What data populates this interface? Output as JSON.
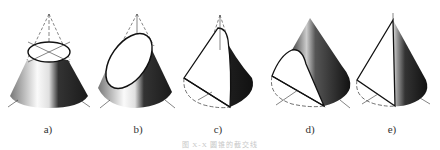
{
  "figure": {
    "caption": "图 X-X  圆锥的截交线",
    "panels": [
      {
        "id": "a",
        "label": "a)",
        "section": "circle (plane perpendicular to axis)"
      },
      {
        "id": "b",
        "label": "b)",
        "section": "ellipse (inclined plane)"
      },
      {
        "id": "c",
        "label": "c)",
        "section": "parabola (plane parallel to one generatrix)"
      },
      {
        "id": "d",
        "label": "d)",
        "section": "hyperbola (plane parallel to axis)"
      },
      {
        "id": "e",
        "label": "e)",
        "section": "triangle (plane through apex)"
      }
    ],
    "colors": {
      "outline": "#111111",
      "shade_dark": "#1a1a1a",
      "shade_light": "#f2f2f2",
      "background": "#ffffff"
    }
  }
}
